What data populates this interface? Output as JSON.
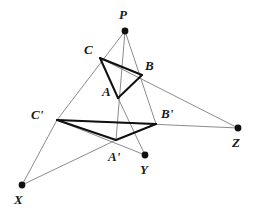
{
  "diagram": {
    "background_color": "#ffffff",
    "triangle_stroke_color": "#101010",
    "projection_stroke_color": "#8c8c8c",
    "point_fill_color": "#101010",
    "label_color": "#1a1a1a",
    "triangle_stroke_width": "2",
    "projection_stroke_width": "1",
    "points": {
      "P": {
        "label": "P",
        "x": 125,
        "y": 31,
        "label_x": 119,
        "label_y": 8,
        "dot": true,
        "dot_r": 3.4
      },
      "C": {
        "label": "C",
        "x": 100,
        "y": 58,
        "label_x": 84,
        "label_y": 43,
        "dot": false,
        "dot_r": 0
      },
      "B": {
        "label": "B",
        "x": 142,
        "y": 75,
        "label_x": 145,
        "label_y": 59,
        "dot": false,
        "dot_r": 0
      },
      "A": {
        "label": "A",
        "x": 118,
        "y": 98,
        "label_x": 102,
        "label_y": 85,
        "dot": false,
        "dot_r": 0
      },
      "Cp": {
        "label": "C'",
        "x": 57,
        "y": 120,
        "label_x": 31,
        "label_y": 108,
        "dot": false,
        "dot_r": 0
      },
      "Bp": {
        "label": "B'",
        "x": 156,
        "y": 124,
        "label_x": 161,
        "label_y": 107,
        "dot": false,
        "dot_r": 0
      },
      "Ap": {
        "label": "A'",
        "x": 116,
        "y": 140,
        "label_x": 108,
        "label_y": 150,
        "dot": false,
        "dot_r": 0
      },
      "Y": {
        "label": "Y",
        "x": 145,
        "y": 155,
        "label_x": 140,
        "label_y": 163,
        "dot": true,
        "dot_r": 3.4
      },
      "Z": {
        "label": "Z",
        "x": 238,
        "y": 128,
        "label_x": 232,
        "label_y": 136,
        "dot": true,
        "dot_r": 3.4
      },
      "X": {
        "label": "X",
        "x": 22,
        "y": 185,
        "label_x": 14,
        "label_y": 193,
        "dot": true,
        "dot_r": 3.4
      }
    },
    "triangle_edges": [
      {
        "name": "edge-C-B",
        "from": "C",
        "to": "B"
      },
      {
        "name": "edge-B-A",
        "from": "B",
        "to": "A"
      },
      {
        "name": "edge-A-C",
        "from": "A",
        "to": "C"
      },
      {
        "name": "edge-Cp-Bp",
        "from": "Cp",
        "to": "Bp"
      },
      {
        "name": "edge-Bp-Ap",
        "from": "Bp",
        "to": "Ap"
      },
      {
        "name": "edge-Ap-Cp",
        "from": "Ap",
        "to": "Cp"
      }
    ],
    "projection_rays": [
      {
        "name": "ray-P-to-Ap",
        "from": "P",
        "to": "Ap"
      },
      {
        "name": "ray-P-to-Bp",
        "from": "P",
        "to": "Bp"
      },
      {
        "name": "ray-P-to-Cp",
        "from": "P",
        "to": "Cp"
      }
    ],
    "axis_lines": [
      {
        "name": "line-X-to-C",
        "from": "X",
        "to": "C"
      },
      {
        "name": "line-X-to-Bp",
        "from": "X",
        "to": "Bp"
      },
      {
        "name": "line-Z-to-B",
        "from": "Z",
        "to": "C"
      },
      {
        "name": "line-Z-to-Bp",
        "from": "Z",
        "to": "Cp"
      },
      {
        "name": "line-Y-to-A",
        "from": "Y",
        "to": "C"
      },
      {
        "name": "line-Y-to-Ap",
        "from": "Y",
        "to": "Cp"
      }
    ]
  }
}
